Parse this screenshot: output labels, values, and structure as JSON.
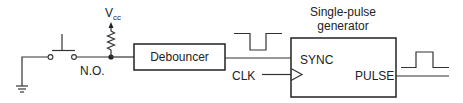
{
  "diagram": {
    "type": "circuit-block-diagram",
    "labels": {
      "vcc_main": "V",
      "vcc_sub": "cc",
      "switch": "N.O.",
      "debouncer": "Debouncer",
      "generator_title_line1": "Single-pulse",
      "generator_title_line2": "generator",
      "sync": "SYNC",
      "clk": "CLK",
      "pulse": "PULSE"
    },
    "components": [
      {
        "id": "ground",
        "kind": "ground-symbol"
      },
      {
        "id": "switch",
        "kind": "normally-open-pushbutton",
        "label": "N.O."
      },
      {
        "id": "pullup",
        "kind": "resistor",
        "to": "Vcc"
      },
      {
        "id": "debouncer",
        "kind": "block",
        "label": "Debouncer"
      },
      {
        "id": "generator",
        "kind": "block",
        "label": "Single-pulse generator",
        "inputs": [
          "SYNC",
          "CLK"
        ],
        "outputs": [
          "PULSE"
        ]
      }
    ],
    "connections": [
      [
        "ground",
        "switch"
      ],
      [
        "switch",
        "pullup"
      ],
      [
        "switch",
        "debouncer"
      ],
      [
        "debouncer",
        "generator.SYNC"
      ],
      [
        "CLK",
        "generator.CLK"
      ],
      [
        "generator.PULSE",
        "output"
      ]
    ],
    "waveforms": [
      {
        "id": "debounced-signal",
        "shape": "active-low-pulse"
      },
      {
        "id": "output-pulse",
        "shape": "active-high-pulse"
      }
    ],
    "colors": {
      "line": "#333333",
      "background": "#ffffff"
    }
  }
}
